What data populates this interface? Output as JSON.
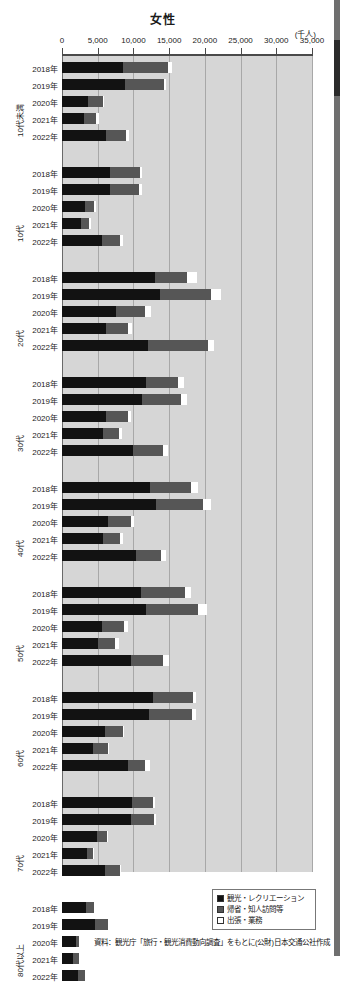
{
  "chart_data": {
    "type": "bar",
    "orientation": "horizontal",
    "stacked": true,
    "title": "女性",
    "unit_label": "(千人)",
    "xlabel": "",
    "ylabel": "",
    "xlim": [
      0,
      35000
    ],
    "xticks": [
      0,
      5000,
      10000,
      15000,
      20000,
      25000,
      30000,
      35000
    ],
    "xtick_labels": [
      "0",
      "5,000",
      "10,000",
      "15,000",
      "20,000",
      "25,000",
      "30,000",
      "35,000"
    ],
    "grid": true,
    "legend_position": "bottom-right",
    "series": [
      {
        "name": "観光・レクリエーション",
        "color": "#121212"
      },
      {
        "name": "帰省・知人訪問等",
        "color": "#565656"
      },
      {
        "name": "出張・業務",
        "color": "#ffffff"
      }
    ],
    "groups": [
      {
        "label": "10代未満",
        "years": [
          "2018年",
          "2019年",
          "2020年",
          "2021年",
          "2022年"
        ],
        "values": [
          [
            8600,
            6300,
            500
          ],
          [
            8800,
            5500,
            300
          ],
          [
            3600,
            2100,
            100
          ],
          [
            3100,
            1700,
            400
          ],
          [
            6100,
            2800,
            500
          ]
        ]
      },
      {
        "label": "10代",
        "years": [
          "2018年",
          "2019年",
          "2020年",
          "2021年",
          "2022年"
        ],
        "values": [
          [
            6700,
            4200,
            300
          ],
          [
            6700,
            4100,
            400
          ],
          [
            3200,
            1300,
            200
          ],
          [
            2700,
            1100,
            300
          ],
          [
            5600,
            2500,
            400
          ]
        ]
      },
      {
        "label": "20代",
        "years": [
          "2018年",
          "2019年",
          "2020年",
          "2021年",
          "2022年"
        ],
        "values": [
          [
            13000,
            4500,
            1400
          ],
          [
            13700,
            7200,
            1400
          ],
          [
            7600,
            4000,
            900
          ],
          [
            6100,
            3100,
            600
          ],
          [
            12000,
            8400,
            900
          ]
        ]
      },
      {
        "label": "30代",
        "years": [
          "2018年",
          "2019年",
          "2020年",
          "2021年",
          "2022年"
        ],
        "values": [
          [
            11800,
            4500,
            800
          ],
          [
            11200,
            5400,
            900
          ],
          [
            6200,
            3000,
            400
          ],
          [
            5700,
            2300,
            400
          ],
          [
            9900,
            4200,
            700
          ]
        ]
      },
      {
        "label": "40代",
        "years": [
          "2018年",
          "2019年",
          "2020年",
          "2021年",
          "2022年"
        ],
        "values": [
          [
            12300,
            5700,
            1000
          ],
          [
            13100,
            6600,
            1200
          ],
          [
            6400,
            3200,
            500
          ],
          [
            5700,
            2400,
            500
          ],
          [
            10300,
            3500,
            700
          ]
        ]
      },
      {
        "label": "50代",
        "years": [
          "2018年",
          "2019年",
          "2020年",
          "2021年",
          "2022年"
        ],
        "values": [
          [
            11000,
            6200,
            800
          ],
          [
            11800,
            7200,
            1300
          ],
          [
            5600,
            3100,
            500
          ],
          [
            5100,
            2300,
            600
          ],
          [
            9700,
            4400,
            900
          ]
        ]
      },
      {
        "label": "60代",
        "years": [
          "2018年",
          "2019年",
          "2020年",
          "2021年",
          "2022年"
        ],
        "values": [
          [
            12800,
            5500,
            500
          ],
          [
            12200,
            6000,
            500
          ],
          [
            6000,
            2500,
            100
          ],
          [
            4400,
            2000,
            100
          ],
          [
            9300,
            2300,
            700
          ]
        ]
      },
      {
        "label": "70代",
        "years": [
          "2018年",
          "2019年",
          "2020年",
          "2021年",
          "2022年"
        ],
        "values": [
          [
            9800,
            3000,
            200
          ],
          [
            9700,
            3200,
            200
          ],
          [
            4900,
            1400,
            100
          ],
          [
            3500,
            900,
            100
          ],
          [
            6000,
            2100,
            100
          ]
        ]
      },
      {
        "label": "80代以上",
        "years": [
          "2018年",
          "2019年",
          "2020年",
          "2021年",
          "2022年"
        ],
        "values": [
          [
            3300,
            1200,
            0
          ],
          [
            4600,
            1800,
            100
          ],
          [
            1900,
            500,
            0
          ],
          [
            1600,
            800,
            0
          ],
          [
            2300,
            900,
            0
          ]
        ]
      }
    ]
  },
  "legend": {
    "items": [
      {
        "label": "観光・レクリエーション",
        "color": "#121212"
      },
      {
        "label": "帰省・知人訪問等",
        "color": "#565656"
      },
      {
        "label": "出張・業務",
        "color": "#ffffff"
      }
    ]
  },
  "source_note": "資料：観光庁「旅行・観光消費動向調査」をもとに(公財)日本交通公社作成"
}
